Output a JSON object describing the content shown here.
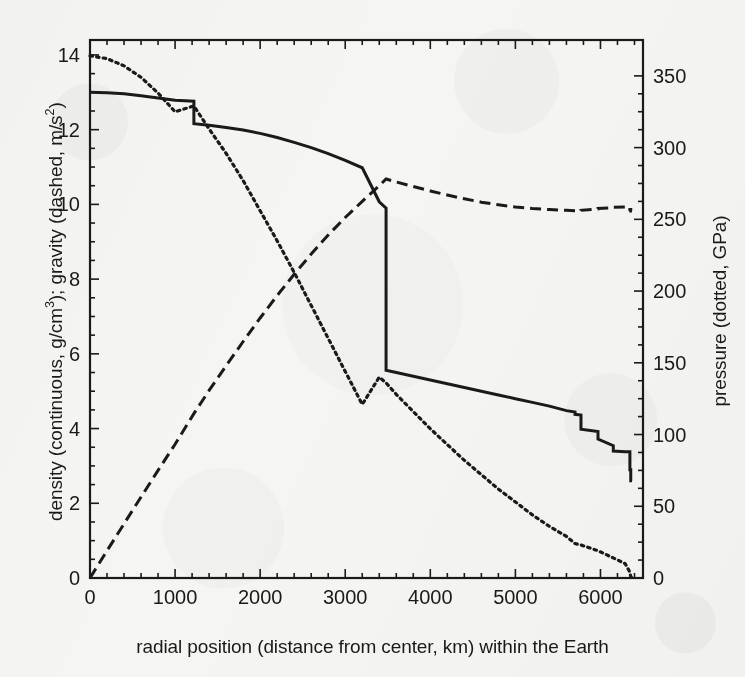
{
  "figure": {
    "background_color": "#f5f5f3",
    "ink_color": "#1a1a1a"
  },
  "axes": {
    "left_title": "density (continuous, g/cm³); gravity (dashed, m/s²)",
    "right_title": "pressure (dotted, GPa)",
    "x_title": "radial position (distance from center, km) within the Earth",
    "x_ticks": [
      "0",
      "1000",
      "2000",
      "3000",
      "4000",
      "5000",
      "6000"
    ],
    "y_left_ticks": [
      "0",
      "2",
      "4",
      "6",
      "8",
      "10",
      "12",
      "14"
    ],
    "y_right_ticks": [
      "0",
      "50",
      "100",
      "150",
      "200",
      "250",
      "300",
      "350"
    ]
  },
  "chart_data": {
    "type": "line",
    "title": "",
    "subtitle": "",
    "xlabel": "radial position (distance from center, km) within the Earth",
    "ylabel": "density (continuous, g/cm³); gravity (dashed, m/s²)",
    "ylabel_secondary": "pressure (dotted, GPa)",
    "xlim": [
      0,
      6500
    ],
    "ylim": [
      0,
      14.4
    ],
    "ylim_secondary": [
      0,
      375
    ],
    "grid": false,
    "legend": "none (curves identified in axis titles by line style)",
    "xticks": [
      0,
      1000,
      2000,
      3000,
      4000,
      5000,
      6000
    ],
    "yticks": [
      0,
      2,
      4,
      6,
      8,
      10,
      12,
      14
    ],
    "yticks_secondary": [
      0,
      50,
      100,
      150,
      200,
      250,
      300,
      350
    ],
    "minor_ticks": true,
    "x": [
      0,
      200,
      400,
      600,
      800,
      1000,
      1221,
      1221,
      1400,
      1600,
      1800,
      2000,
      2200,
      2400,
      2600,
      2800,
      3000,
      3200,
      3400,
      3480,
      3480,
      3600,
      3800,
      4000,
      4200,
      4400,
      4600,
      4800,
      5000,
      5200,
      5400,
      5600,
      5701,
      5701,
      5771,
      5771,
      5971,
      5971,
      6151,
      6151,
      6291,
      6346,
      6346,
      6356,
      6356,
      6371
    ],
    "series": [
      {
        "name": "density",
        "style": "continuous",
        "axis": "left",
        "unit": "g/cm³",
        "values": [
          13.0,
          12.99,
          12.96,
          12.91,
          12.85,
          12.79,
          12.76,
          12.16,
          12.12,
          12.06,
          11.99,
          11.9,
          11.79,
          11.66,
          11.52,
          11.36,
          11.18,
          10.98,
          10.07,
          9.9,
          5.56,
          5.5,
          5.4,
          5.3,
          5.2,
          5.1,
          5.0,
          4.9,
          4.8,
          4.7,
          4.6,
          4.48,
          4.44,
          4.38,
          4.36,
          3.98,
          3.92,
          3.72,
          3.54,
          3.4,
          3.38,
          3.38,
          2.9,
          2.9,
          2.6,
          2.6
        ]
      },
      {
        "name": "gravity",
        "style": "dashed",
        "axis": "left",
        "unit": "m/s²",
        "values": [
          0.0,
          0.73,
          1.45,
          2.17,
          2.88,
          3.58,
          4.4,
          4.4,
          5.02,
          5.68,
          6.33,
          6.96,
          7.56,
          8.13,
          8.67,
          9.18,
          9.65,
          10.08,
          10.5,
          10.68,
          10.68,
          10.6,
          10.48,
          10.36,
          10.25,
          10.15,
          10.06,
          9.99,
          9.93,
          9.89,
          9.86,
          9.84,
          9.83,
          9.83,
          9.83,
          9.84,
          9.88,
          9.89,
          9.91,
          9.92,
          9.93,
          9.93,
          9.86,
          9.86,
          9.82,
          9.82
        ]
      },
      {
        "name": "pressure",
        "style": "dotted",
        "axis": "right",
        "unit": "GPa",
        "values": [
          364,
          362,
          357,
          349,
          338,
          325,
          329,
          329,
          313,
          296,
          277,
          256,
          235,
          213,
          190,
          167,
          144,
          121,
          140,
          136,
          136,
          128,
          116,
          104,
          93,
          82,
          72,
          62,
          53,
          44,
          36,
          29,
          24,
          24,
          23,
          23,
          19,
          19,
          14,
          14,
          10,
          4,
          4,
          1,
          1,
          0
        ]
      }
    ],
    "annotations": [
      {
        "label": "inner core boundary",
        "x": 1221,
        "note": "density step down 12.76 -> 12.16"
      },
      {
        "label": "core-mantle boundary",
        "x": 3480,
        "note": "density step down 9.90 -> 5.56; gravity maximum 10.68"
      },
      {
        "label": "670 km discontinuity",
        "x": 5701,
        "note": "density step down 4.38 -> 3.98"
      },
      {
        "label": "400 km discontinuity",
        "x": 5971,
        "note": "density step down 3.72 -> 3.54"
      },
      {
        "label": "Moho / crust",
        "x": 6346,
        "note": "density step down 3.38 -> 2.9 -> 2.6"
      }
    ]
  }
}
